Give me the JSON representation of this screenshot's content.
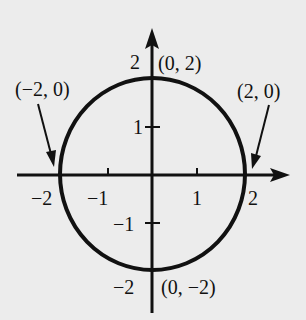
{
  "figure": {
    "background": "#ececec",
    "ink": "#111111",
    "axes": {
      "x_ticks": [
        {
          "value": -2,
          "label": "−2"
        },
        {
          "value": -1,
          "label": "−1"
        },
        {
          "value": 1,
          "label": "1"
        },
        {
          "value": 2,
          "label": "2"
        }
      ],
      "y_ticks": [
        {
          "value": 2,
          "label": "2"
        },
        {
          "value": 1,
          "label": "1"
        },
        {
          "value": -1,
          "label": "−1"
        },
        {
          "value": -2,
          "label": "−2"
        }
      ]
    },
    "points": {
      "top": "(0, 2)",
      "bottom": "(0, −2)",
      "left": "(−2, 0)",
      "right": "(2, 0)"
    },
    "curve": {
      "type": "circle",
      "center": [
        0,
        0
      ],
      "radius": 2
    }
  }
}
